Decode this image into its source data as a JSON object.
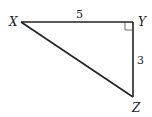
{
  "diagram": {
    "type": "right-triangle",
    "vertices": [
      {
        "label": "X",
        "x": 21,
        "y": 22
      },
      {
        "label": "Y",
        "x": 133,
        "y": 22
      },
      {
        "label": "Z",
        "x": 133,
        "y": 97
      }
    ],
    "labels": {
      "X": "X",
      "Y": "Y",
      "Z": "Z"
    },
    "sides": {
      "XY": "5",
      "YZ": "3"
    },
    "right_angle_at": "Y",
    "colors": {
      "stroke": "#222222",
      "background": "#ffffff"
    }
  }
}
